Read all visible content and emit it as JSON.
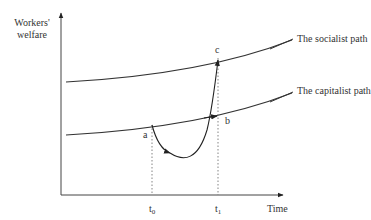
{
  "diagram": {
    "y_axis": {
      "label_line1": "Workers'",
      "label_line2": "welfare"
    },
    "x_axis": {
      "label": "Time"
    },
    "curves": [
      {
        "name": "socialist-path",
        "label": "The socialist path"
      },
      {
        "name": "capitalist-path",
        "label": "The capitalist path"
      }
    ],
    "points": {
      "a": "a",
      "b": "b",
      "c": "c"
    },
    "ticks": {
      "t0": {
        "base": "t",
        "sub": "0"
      },
      "t1": {
        "base": "t",
        "sub": "1"
      }
    },
    "colors": {
      "line": "#333333",
      "background": "#ffffff"
    }
  }
}
